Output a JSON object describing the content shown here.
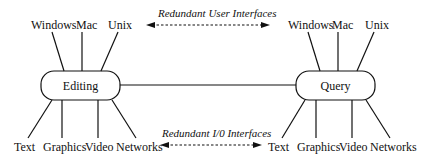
{
  "diagram": {
    "left_node": {
      "label": "Editing",
      "top_labels": [
        "Windows",
        "Mac",
        "Unix"
      ],
      "bottom_labels": [
        "Text",
        "Graphics",
        "Video",
        "Networks"
      ]
    },
    "right_node": {
      "label": "Query",
      "top_labels": [
        "Windows",
        "Mac",
        "Unix"
      ],
      "bottom_labels": [
        "Text",
        "Graphics",
        "Video",
        "Networks"
      ]
    },
    "top_annotation": "Redundant User Interfaces",
    "bottom_annotation": "Redundant I/0 Interfaces"
  }
}
